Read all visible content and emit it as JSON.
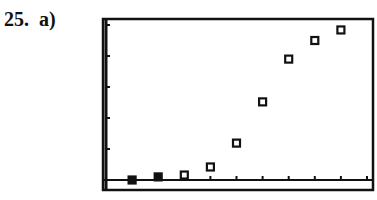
{
  "problem": {
    "number": "25.",
    "part": "a)"
  },
  "colors": {
    "ink": "#111111",
    "background": "#ffffff"
  },
  "chart_data": {
    "type": "scatter",
    "title": "",
    "xlabel": "",
    "ylabel": "",
    "marker": "hollow-square",
    "grid": false,
    "legend": null,
    "x_ticks": 10,
    "y_ticks": 5,
    "x": [
      1,
      2,
      3,
      4,
      5,
      6,
      7,
      8,
      9
    ],
    "y": [
      0.0,
      0.1,
      0.16,
      0.42,
      1.19,
      2.52,
      3.9,
      4.5,
      4.84
    ],
    "xlim": [
      0,
      10.3
    ],
    "ylim": [
      -0.3,
      5.15
    ],
    "note": "Calculator-style scatter plot; axes unlabeled, values in tick units (one tick = one unit)"
  }
}
